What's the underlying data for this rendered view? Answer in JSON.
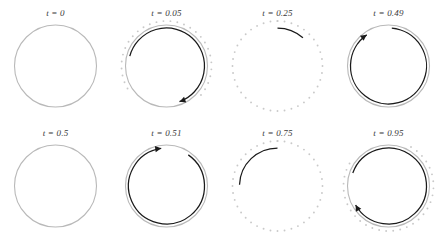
{
  "figure": {
    "title": "",
    "rows": 2,
    "cols": 4,
    "background": "#ffffff"
  },
  "colors": {
    "solid_circle": "#b9b9b9",
    "dotted_circle": "#c9c9c9",
    "arc_dark": "#1a1a1a",
    "label_text": "#3a3a3a"
  },
  "chart_data": {
    "type": "line",
    "title": "",
    "xlabel": "",
    "ylabel": "",
    "grid": false,
    "legend": "none",
    "panels": [
      {
        "label": "t = 0",
        "t": 0,
        "row": 0,
        "col": 0,
        "has_solid_circle": true,
        "has_dotted_circle": false,
        "dotted_start_deg": 0,
        "dotted_end_deg": 0,
        "has_dark_arc": false,
        "arc_start_deg": 0,
        "arc_end_deg": 0,
        "has_arrowhead": false,
        "arrow_direction": "none"
      },
      {
        "label": "t = 0.05",
        "t": 0.05,
        "row": 0,
        "col": 1,
        "has_solid_circle": true,
        "has_dotted_circle": true,
        "dotted_start_deg": -120,
        "dotted_end_deg": 130,
        "has_dark_arc": true,
        "arc_start_deg": -75,
        "arc_end_deg": 160,
        "has_arrowhead": true,
        "arrow_direction": "clockwise"
      },
      {
        "label": "t = 0.25",
        "t": 0.25,
        "row": 0,
        "col": 2,
        "has_solid_circle": false,
        "has_dotted_circle": true,
        "dotted_start_deg": 0,
        "dotted_end_deg": 360,
        "has_dark_arc": true,
        "arc_start_deg": 0,
        "arc_end_deg": 42,
        "has_arrowhead": false,
        "arrow_direction": "none"
      },
      {
        "label": "t = 0.49",
        "t": 0.49,
        "row": 0,
        "col": 3,
        "has_solid_circle": true,
        "has_dotted_circle": false,
        "dotted_start_deg": 0,
        "dotted_end_deg": 0,
        "has_dark_arc": true,
        "arc_start_deg": 5,
        "arc_end_deg": 325,
        "has_arrowhead": true,
        "arrow_direction": "clockwise"
      },
      {
        "label": "t = 0.5",
        "t": 0.5,
        "row": 1,
        "col": 0,
        "has_solid_circle": true,
        "has_dotted_circle": false,
        "dotted_start_deg": 0,
        "dotted_end_deg": 0,
        "has_dark_arc": false,
        "arc_start_deg": 0,
        "arc_end_deg": 0,
        "has_arrowhead": false,
        "arrow_direction": "none"
      },
      {
        "label": "t = 0.51",
        "t": 0.51,
        "row": 1,
        "col": 1,
        "has_solid_circle": true,
        "has_dotted_circle": false,
        "dotted_start_deg": 0,
        "dotted_end_deg": 0,
        "has_dark_arc": true,
        "arc_start_deg": 35,
        "arc_end_deg": 352,
        "has_arrowhead": true,
        "arrow_direction": "clockwise"
      },
      {
        "label": "t = 0.75",
        "t": 0.75,
        "row": 1,
        "col": 2,
        "has_solid_circle": false,
        "has_dotted_circle": true,
        "dotted_start_deg": 0,
        "dotted_end_deg": 360,
        "has_dark_arc": true,
        "arc_start_deg": 272,
        "arc_end_deg": 360,
        "has_arrowhead": false,
        "arrow_direction": "none"
      },
      {
        "label": "t = 0.95",
        "t": 0.95,
        "row": 1,
        "col": 3,
        "has_solid_circle": true,
        "has_dotted_circle": true,
        "dotted_start_deg": 30,
        "dotted_end_deg": 300,
        "has_dark_arc": true,
        "arc_start_deg": 290,
        "arc_end_deg": 600,
        "has_arrowhead": true,
        "arrow_direction": "clockwise"
      }
    ]
  }
}
